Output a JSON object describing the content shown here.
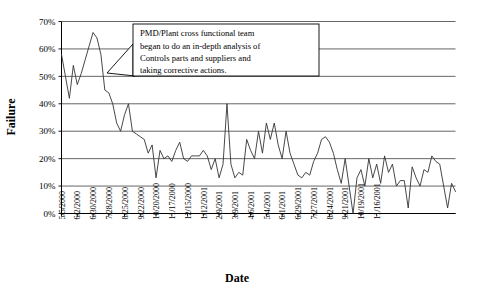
{
  "chart_data": {
    "type": "line",
    "title": "",
    "xlabel": "Date",
    "ylabel": "Failure",
    "ylim": [
      0,
      70
    ],
    "ytick_labels": [
      "0%",
      "10%",
      "20%",
      "30%",
      "40%",
      "50%",
      "60%",
      "70%"
    ],
    "ytick_values": [
      0,
      10,
      20,
      30,
      40,
      50,
      60,
      70
    ],
    "grid": true,
    "legend": "none",
    "xtick_labels": [
      "5/5/2000",
      "6/2/2000",
      "6/30/2000",
      "7/28/2000",
      "8/25/2000",
      "9/22/2000",
      "10/20/2000",
      "11/17/2000",
      "12/15/2000",
      "1/12/2001",
      "2/9/2001",
      "3/9/2001",
      "4/6/2001",
      "5/4/2001",
      "6/1/2001",
      "6/29/2001",
      "7/27/2001",
      "8/24/2001",
      "9/21/2001",
      "10/19/2001",
      "11/16/2001"
    ],
    "xtick_interval_points": 4,
    "series": [
      {
        "name": "Failure rate",
        "values": [
          58,
          50,
          42,
          54,
          47,
          51,
          56,
          61,
          66,
          64,
          58,
          45,
          44,
          40,
          33,
          30,
          36,
          40,
          30,
          29,
          28,
          27,
          22,
          25,
          13,
          23,
          20,
          21,
          19,
          23,
          26,
          20,
          19,
          21,
          21,
          21,
          23,
          21,
          16,
          20,
          13,
          18,
          40,
          18,
          13,
          15,
          14,
          27,
          23,
          20,
          30,
          22,
          33,
          27,
          33,
          25,
          20,
          30,
          22,
          18,
          14,
          13,
          15,
          14,
          19,
          22,
          27,
          28,
          26,
          22,
          16,
          11,
          20,
          10,
          0,
          13,
          16,
          10,
          20,
          13,
          18,
          11,
          21,
          15,
          18,
          10,
          12,
          12,
          2,
          17,
          13,
          10,
          16,
          15,
          21,
          19,
          18,
          10,
          2,
          11,
          8
        ]
      }
    ],
    "annotations": [
      {
        "name": "pmd-callout",
        "lines": [
          "PMD/Plant cross functional team",
          "began to do an in-depth analysis of",
          "Controls parts and suppliers and",
          "taking corrective actions."
        ],
        "points_to_index": 10
      }
    ],
    "colors": {
      "line": "#333333",
      "grid": "#555555",
      "axis": "#000000",
      "callout_border": "#000000",
      "callout_fill": "#ffffff"
    }
  }
}
